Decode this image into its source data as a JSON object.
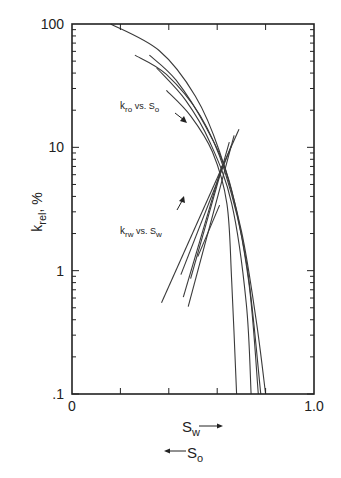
{
  "chart_data": {
    "type": "line",
    "title": "",
    "xlabel": "S_w (increasing →) / S_o (increasing ←)",
    "ylabel": "k_rel, %",
    "xlim": [
      0,
      1.0
    ],
    "ylim": [
      0.1,
      100
    ],
    "yscale": "log",
    "x_tick_labels": [
      "0",
      "1.0"
    ],
    "x_minor_ticks": [
      0.2,
      0.4,
      0.6,
      0.8
    ],
    "y_tick_labels": [
      ".1",
      "1",
      "10",
      "100"
    ],
    "grid": false,
    "legend": "none",
    "annotations": [
      {
        "text_main": "k",
        "text_sub": "ro",
        "text_mid": " vs. S",
        "text_sub2": "o",
        "x": 0.23,
        "y": 23,
        "arrow": "down-right"
      },
      {
        "text_main": "k",
        "text_sub": "rw",
        "text_mid": " vs. S",
        "text_sub2": "w",
        "x": 0.23,
        "y": 2.2,
        "arrow": "up-right"
      }
    ],
    "series": [
      {
        "name": "kro vs So curve 1",
        "group": "kro",
        "x": [
          0.16,
          0.36,
          0.51,
          0.61,
          0.7,
          0.76,
          0.8
        ],
        "y": [
          100,
          61,
          26,
          9.2,
          2.1,
          0.41,
          0.1
        ]
      },
      {
        "name": "kro vs So curve 2",
        "group": "kro",
        "x": [
          0.26,
          0.39,
          0.53,
          0.63,
          0.72,
          0.78
        ],
        "y": [
          56,
          39,
          18,
          6.5,
          1.2,
          0.1
        ]
      },
      {
        "name": "kro vs So curve 3",
        "group": "kro",
        "x": [
          0.32,
          0.43,
          0.55,
          0.65,
          0.73,
          0.77
        ],
        "y": [
          56,
          35,
          15,
          5.3,
          0.82,
          0.1
        ]
      },
      {
        "name": "kro vs So curve 4",
        "group": "kro",
        "x": [
          0.35,
          0.47,
          0.57,
          0.66,
          0.72,
          0.74
        ],
        "y": [
          44,
          24,
          11,
          3.5,
          0.55,
          0.1
        ]
      },
      {
        "name": "kro vs So curve 5",
        "group": "kro",
        "x": [
          0.39,
          0.49,
          0.58,
          0.64,
          0.66,
          0.68
        ],
        "y": [
          29,
          18,
          9.2,
          3.5,
          0.82,
          0.1
        ]
      },
      {
        "name": "krw vs Sw line 1",
        "group": "krw",
        "x": [
          0.37,
          0.69
        ],
        "y": [
          0.55,
          14
        ]
      },
      {
        "name": "krw vs Sw line 2",
        "group": "krw",
        "x": [
          0.45,
          0.66
        ],
        "y": [
          0.93,
          10.5
        ]
      },
      {
        "name": "krw vs Sw line 3",
        "group": "krw",
        "x": [
          0.48,
          0.67
        ],
        "y": [
          0.51,
          12.5
        ]
      },
      {
        "name": "krw vs Sw line 4",
        "group": "krw",
        "x": [
          0.49,
          0.65
        ],
        "y": [
          0.86,
          11
        ]
      },
      {
        "name": "krw vs Sw line 5",
        "group": "krw",
        "x": [
          0.52,
          0.61
        ],
        "y": [
          1.3,
          3.4
        ]
      },
      {
        "name": "krw vs Sw line 6",
        "group": "krw",
        "x": [
          0.46,
          0.62
        ],
        "y": [
          0.61,
          7.1
        ]
      }
    ]
  },
  "axes": {
    "y_label_main": "k",
    "y_label_sub": "rel",
    "y_label_tail": ", %",
    "y_ticks": [
      {
        "label": "100",
        "value": 100
      },
      {
        "label": "10",
        "value": 10
      },
      {
        "label": "1",
        "value": 1
      },
      {
        "label": ".1",
        "value": 0.1
      }
    ],
    "x_ticks": [
      {
        "label": "0",
        "value": 0
      },
      {
        "label": "1.0",
        "value": 1.0
      }
    ],
    "x_axis_label_1": {
      "main": "S",
      "sub": "w"
    },
    "x_axis_label_2": {
      "main": "S",
      "sub": "o"
    }
  },
  "colors": {
    "line": "#3a3a3a",
    "axis": "#222222",
    "background": "#ffffff"
  }
}
